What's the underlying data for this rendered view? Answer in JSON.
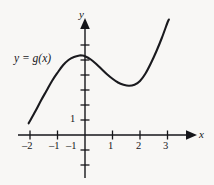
{
  "figure": {
    "background_color": "#f8f7f5",
    "ink_color": "#16161a",
    "curve_label": "y = g(x)",
    "x_axis_name": "x",
    "y_axis_name": "y"
  },
  "axes": {
    "x_tick_labels": [
      "–2",
      "–1",
      "1",
      "2",
      "3"
    ],
    "y_tick_labels": [
      "1",
      "–1"
    ]
  },
  "chart_data": {
    "type": "line",
    "title": "",
    "xlabel": "x",
    "ylabel": "y",
    "series_name": "y = g(x)",
    "annotations": [
      "y = g(x)"
    ],
    "grid": false,
    "legend": "none",
    "xlim": [
      -2.45,
      4.0
    ],
    "ylim": [
      -2.1,
      7.5
    ],
    "x_ticks": [
      -2,
      -1,
      1,
      2,
      3
    ],
    "x_tick_labels": [
      "–2",
      "–1",
      "1",
      "2",
      "3"
    ],
    "y_ticks": [
      -2,
      -1,
      1,
      2,
      3,
      4,
      5,
      6
    ],
    "y_tick_labels_shown": {
      "1": "1",
      "-1": "–1"
    },
    "x": [
      -2.05,
      -1.8,
      -1.6,
      -1.4,
      -1.2,
      -1.0,
      -0.8,
      -0.6,
      -0.4,
      -0.2,
      -0.1,
      0.0,
      0.2,
      0.4,
      0.6,
      0.8,
      1.0,
      1.2,
      1.4,
      1.6,
      1.8,
      2.0,
      2.2,
      2.4,
      2.6,
      2.8,
      3.0,
      3.05
    ],
    "y": [
      0.78,
      1.6,
      2.3,
      2.95,
      3.6,
      4.15,
      4.65,
      5.0,
      5.2,
      5.3,
      5.3,
      5.25,
      5.05,
      4.75,
      4.4,
      4.05,
      3.75,
      3.5,
      3.35,
      3.28,
      3.35,
      3.6,
      4.1,
      4.8,
      5.6,
      6.5,
      7.5,
      7.7
    ],
    "local_maximum": {
      "x": -0.15,
      "y": 5.3
    },
    "local_minimum": {
      "x": 1.62,
      "y": 3.28
    },
    "x_intercepts": [],
    "shape": "cubic"
  }
}
